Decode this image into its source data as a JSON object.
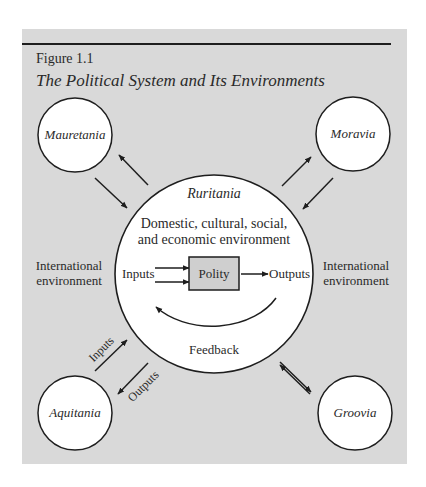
{
  "figure": {
    "label": "Figure 1.1",
    "title": "The Political System and Its Environments"
  },
  "colors": {
    "panel_background": "#d9d9d9",
    "circle_fill": "#ffffff",
    "polity_box_fill": "#cfcfcf",
    "stroke": "#1e1e1e",
    "text": "#2a2a2a"
  },
  "central_system": {
    "name": "Ruritania",
    "environment_line1": "Domestic, cultural, social,",
    "environment_line2": "and economic environment",
    "inputs_label": "Inputs",
    "polity_label": "Polity",
    "outputs_label": "Outputs",
    "feedback_label": "Feedback"
  },
  "external_systems": [
    {
      "name": "Mauretania",
      "position": "top-left"
    },
    {
      "name": "Moravia",
      "position": "top-right"
    },
    {
      "name": "Aquitania",
      "position": "bottom-left"
    },
    {
      "name": "Groovia",
      "position": "bottom-right"
    }
  ],
  "international_environment": {
    "left_line1": "International",
    "left_line2": "environment",
    "right_line1": "International",
    "right_line2": "environment"
  },
  "exchange_labels": {
    "inputs": "Inputs",
    "outputs": "Outputs"
  }
}
